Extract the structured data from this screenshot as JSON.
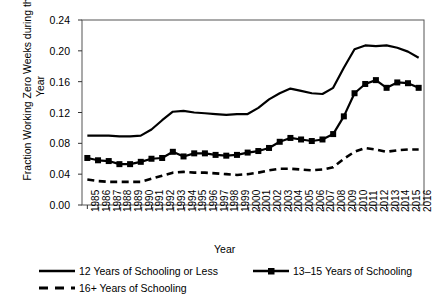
{
  "chart_data": {
    "type": "line",
    "title": "",
    "xlabel": "Year",
    "ylabel": "Fraction Working Zero Weeks during the Year",
    "ylim": [
      0.0,
      0.24
    ],
    "ytick_labels": [
      "0.00",
      "0.04",
      "0.08",
      "0.12",
      "0.16",
      "0.20",
      "0.24"
    ],
    "ytick_values": [
      0.0,
      0.04,
      0.08,
      0.12,
      0.16,
      0.2,
      0.24
    ],
    "grid": false,
    "legend_position": "below-axes",
    "categories": [
      "1985",
      "1986",
      "1987",
      "1988",
      "1989",
      "1990",
      "1991",
      "1992",
      "1993",
      "1994",
      "1995",
      "1996",
      "1997",
      "1998",
      "1999",
      "2000",
      "2001",
      "2002",
      "2003",
      "2004",
      "2005",
      "2006",
      "2007",
      "2008",
      "2009",
      "2010",
      "2011",
      "2012",
      "2013",
      "2014",
      "2015",
      "2016"
    ],
    "x": [
      1985,
      1986,
      1987,
      1988,
      1989,
      1990,
      1991,
      1992,
      1993,
      1994,
      1995,
      1996,
      1997,
      1998,
      1999,
      2000,
      2001,
      2002,
      2003,
      2004,
      2005,
      2006,
      2007,
      2008,
      2009,
      2010,
      2011,
      2012,
      2013,
      2014,
      2015,
      2016
    ],
    "series": [
      {
        "name": "12 Years of Schooling or Less",
        "style": "solid",
        "marker": "none",
        "color": "#000000",
        "values": [
          0.09,
          0.09,
          0.09,
          0.089,
          0.089,
          0.09,
          0.098,
          0.11,
          0.121,
          0.122,
          0.12,
          0.119,
          0.118,
          0.117,
          0.118,
          0.118,
          0.126,
          0.137,
          0.145,
          0.151,
          0.148,
          0.145,
          0.144,
          0.152,
          0.178,
          0.202,
          0.207,
          0.206,
          0.207,
          0.204,
          0.199,
          0.191
        ]
      },
      {
        "name": "13–15 Years of Schooling",
        "style": "solid",
        "marker": "square",
        "color": "#000000",
        "values": [
          0.061,
          0.058,
          0.057,
          0.053,
          0.053,
          0.056,
          0.06,
          0.061,
          0.069,
          0.063,
          0.067,
          0.067,
          0.065,
          0.064,
          0.065,
          0.068,
          0.07,
          0.074,
          0.082,
          0.087,
          0.085,
          0.083,
          0.085,
          0.092,
          0.115,
          0.145,
          0.157,
          0.162,
          0.152,
          0.159,
          0.158,
          0.152
        ]
      },
      {
        "name": "16+ Years of Schooling",
        "style": "dashed",
        "marker": "none",
        "color": "#000000",
        "values": [
          0.033,
          0.031,
          0.03,
          0.03,
          0.03,
          0.03,
          0.034,
          0.038,
          0.042,
          0.043,
          0.042,
          0.042,
          0.041,
          0.04,
          0.039,
          0.04,
          0.042,
          0.045,
          0.047,
          0.047,
          0.046,
          0.045,
          0.046,
          0.049,
          0.06,
          0.069,
          0.074,
          0.072,
          0.069,
          0.071,
          0.072,
          0.072
        ]
      }
    ]
  },
  "legend": {
    "items": [
      {
        "label": "12 Years of Schooling or Less",
        "style": "solid",
        "marker": "none"
      },
      {
        "label": "13–15 Years of Schooling",
        "style": "solid",
        "marker": "square"
      },
      {
        "label": "16+ Years of Schooling",
        "style": "dashed",
        "marker": "none"
      }
    ]
  }
}
